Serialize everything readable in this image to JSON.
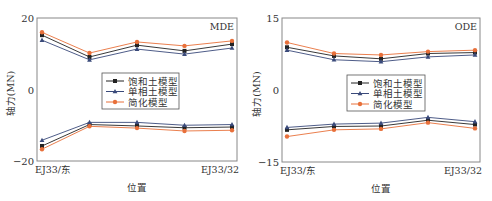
{
  "chart_data": [
    {
      "type": "line",
      "panel_label": "MDE",
      "title": "",
      "xlabel": "位置",
      "ylabel": "轴力(MN)",
      "ylim": [
        -20,
        20
      ],
      "yticks": [
        "20",
        "0",
        "-20"
      ],
      "x_tick_labels": [
        "EJ33/东",
        "EJ33/32"
      ],
      "categories": [
        1,
        2,
        3,
        4,
        5
      ],
      "grid": false,
      "legend_position": "center",
      "series": [
        {
          "name": "饱和土模型",
          "marker": "square",
          "color": "#222222",
          "values_upper": [
            15.2,
            9.1,
            12.4,
            10.8,
            12.7
          ],
          "values_lower": [
            -15.8,
            -9.8,
            -10.2,
            -10.7,
            -10.5
          ]
        },
        {
          "name": "单相土模型",
          "marker": "triangle",
          "color": "#3a4a7a",
          "values_upper": [
            13.8,
            8.3,
            11.3,
            9.9,
            11.6
          ],
          "values_lower": [
            -14.2,
            -9.2,
            -9.2,
            -10.0,
            -9.8
          ]
        },
        {
          "name": "简化模型",
          "marker": "circle",
          "color": "#e8703a",
          "values_upper": [
            16.0,
            10.2,
            13.3,
            12.2,
            13.6
          ],
          "values_lower": [
            -16.7,
            -10.3,
            -10.8,
            -11.6,
            -11.4
          ]
        }
      ]
    },
    {
      "type": "line",
      "panel_label": "ODE",
      "title": "",
      "xlabel": "位置",
      "ylabel": "轴力(MN)",
      "ylim": [
        -15,
        15
      ],
      "yticks": [
        "15",
        "0",
        "-15"
      ],
      "x_tick_labels": [
        "EJ33/东",
        "EJ33/32"
      ],
      "categories": [
        1,
        2,
        3,
        4,
        5
      ],
      "grid": false,
      "legend_position": "center",
      "series": [
        {
          "name": "饱和土模型",
          "marker": "square",
          "color": "#222222",
          "values_upper": [
            8.9,
            7.1,
            6.5,
            7.6,
            7.8
          ],
          "values_lower": [
            -8.3,
            -7.6,
            -7.5,
            -6.3,
            -7.2
          ]
        },
        {
          "name": "单相土模型",
          "marker": "triangle",
          "color": "#3a4a7a",
          "values_upper": [
            8.3,
            6.3,
            5.9,
            6.9,
            7.3
          ],
          "values_lower": [
            -7.8,
            -7.1,
            -6.9,
            -5.7,
            -6.6
          ]
        },
        {
          "name": "简化模型",
          "marker": "circle",
          "color": "#e8703a",
          "values_upper": [
            9.9,
            7.6,
            7.3,
            8.0,
            8.3
          ],
          "values_lower": [
            -9.7,
            -8.3,
            -8.1,
            -6.8,
            -8.0
          ]
        }
      ]
    }
  ]
}
